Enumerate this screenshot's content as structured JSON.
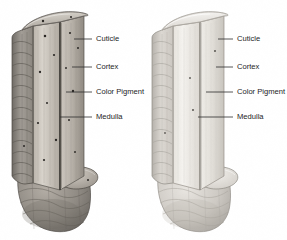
{
  "figure": {
    "background_color": "#ffffff",
    "ink_color": "#1c1c1c"
  },
  "diagrams": [
    {
      "id": "dark-hair",
      "name": "pigmented-hair-shaft",
      "tone": "dark",
      "colors": {
        "cuticle": "#9a968f",
        "cuticle_shadow": "#6e6a64",
        "cortex_light": "#d7d2ca",
        "cortex_mid": "#bdb7ae",
        "cortex_dark": "#8d8880",
        "medulla": "#3b3833",
        "bulb": "#8b8680",
        "pigment": "#2a2724",
        "outline": "#4a4641"
      },
      "pigment_count": 14,
      "labels": [
        {
          "text": "Cuticle",
          "x": 96,
          "y": 39,
          "leader_from_x": 74,
          "leader_to_x": 92,
          "leader_y": 39
        },
        {
          "text": "Cortex",
          "x": 96,
          "y": 67,
          "leader_from_x": 72,
          "leader_to_x": 92,
          "leader_y": 67
        },
        {
          "text": "Color Pigment",
          "x": 96,
          "y": 92,
          "leader_from_x": 66,
          "leader_to_x": 92,
          "leader_y": 92
        },
        {
          "text": "Medulla",
          "x": 96,
          "y": 117,
          "leader_from_x": 60,
          "leader_to_x": 92,
          "leader_y": 117
        }
      ]
    },
    {
      "id": "light-hair",
      "name": "unpigmented-hair-shaft",
      "tone": "light",
      "colors": {
        "cuticle": "#ccc8c2",
        "cuticle_shadow": "#a7a39d",
        "cortex_light": "#f1efeb",
        "cortex_mid": "#e2dfd9",
        "cortex_dark": "#c5c1ba",
        "medulla": "#8e8a84",
        "bulb": "#c8c4be",
        "pigment": "#5d5a55",
        "outline": "#8d8983",
        "pigment_count": 4
      },
      "pigment_count": 4,
      "labels": [
        {
          "text": "Cuticle",
          "x": 237,
          "y": 39,
          "leader_from_x": 218,
          "leader_to_x": 233,
          "leader_y": 39
        },
        {
          "text": "Cortex",
          "x": 237,
          "y": 67,
          "leader_from_x": 216,
          "leader_to_x": 233,
          "leader_y": 67
        },
        {
          "text": "Color Pigment",
          "x": 237,
          "y": 92,
          "leader_from_x": 206,
          "leader_to_x": 233,
          "leader_y": 92
        },
        {
          "text": "Medulla",
          "x": 237,
          "y": 117,
          "leader_from_x": 198,
          "leader_to_x": 233,
          "leader_y": 117
        }
      ]
    }
  ],
  "structures": {
    "cuticle": "Cuticle",
    "cortex": "Cortex",
    "color_pigment": "Color Pigment",
    "medulla": "Medulla"
  }
}
